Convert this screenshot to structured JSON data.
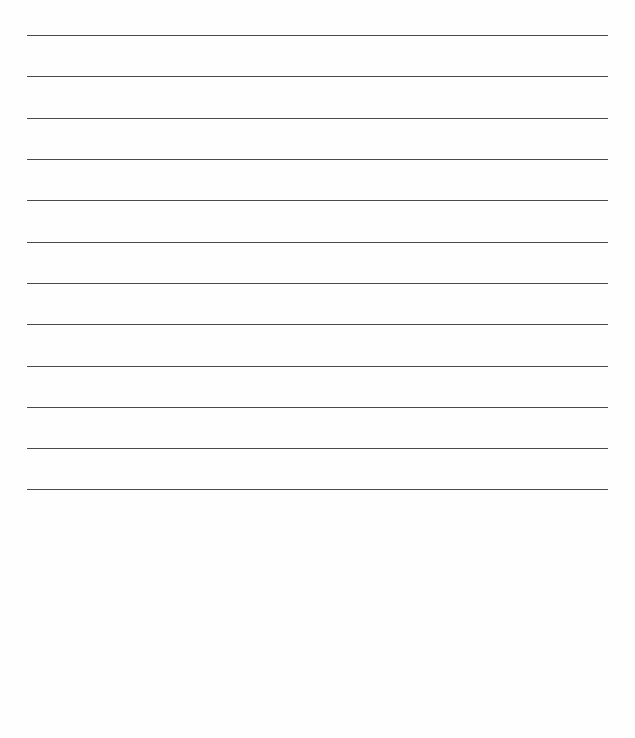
{
  "page": {
    "type": "blank lined writing page",
    "background_color": "#fefefe",
    "rule_color": "#4a4a4a",
    "rule_count": 12,
    "rules": [
      {
        "y": 35
      },
      {
        "y": 76
      },
      {
        "y": 118
      },
      {
        "y": 159
      },
      {
        "y": 200
      },
      {
        "y": 242
      },
      {
        "y": 283
      },
      {
        "y": 324
      },
      {
        "y": 366
      },
      {
        "y": 407
      },
      {
        "y": 448
      },
      {
        "y": 489
      }
    ]
  }
}
